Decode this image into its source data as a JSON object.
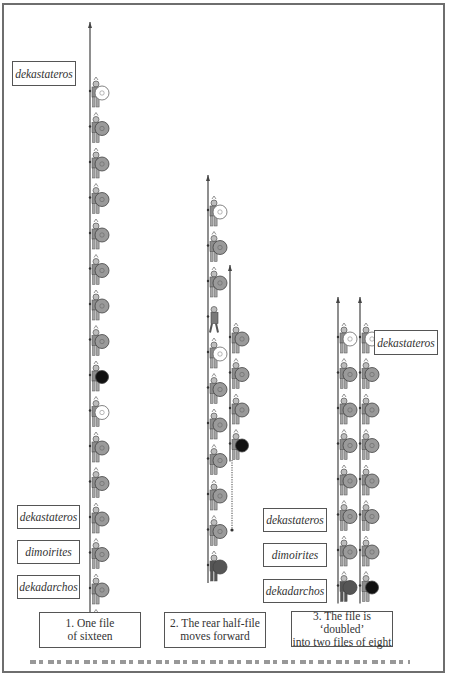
{
  "figure": {
    "colors": {
      "shield_grey": "#9a9a9a",
      "shield_white": "#ffffff",
      "shield_black": "#111111",
      "shield_dark": "#555555",
      "figure_grey": "#8c8c8c",
      "spear": "#444444",
      "box_border": "#555555"
    }
  },
  "labels": {
    "col1_top": "dekastateros",
    "col1_dekastateros": "dekastateros",
    "col1_dimoirites": "dimoirites",
    "col1_dekadarchos": "dekadarchos",
    "col3_top": "dekastateros",
    "col3_dekastateros": "dekastateros",
    "col3_dimoirites": "dimoirites",
    "col3_dekadarchos": "dekadarchos"
  },
  "captions": {
    "step1": {
      "line1": "1. One file",
      "line2": "of sixteen"
    },
    "step2": {
      "line1": "2. The rear half-file",
      "line2": "moves forward"
    },
    "step3": {
      "line1": "3. The file is ‘doubled’",
      "line2": "into two files of eight"
    }
  },
  "columns": [
    {
      "id": "step1-single-file",
      "x": 92,
      "spear_top": 22,
      "soldiers": [
        "white",
        "grey",
        "grey",
        "grey",
        "grey",
        "grey",
        "grey",
        "grey",
        "black",
        "white",
        "grey",
        "grey",
        "grey",
        "grey",
        "grey",
        "dark"
      ],
      "start_y": 97,
      "spacing": 35.5
    },
    {
      "id": "step2-front-half",
      "x": 210,
      "spear_top": 175,
      "soldiers": [
        "white",
        "grey",
        "grey",
        "walking",
        "white",
        "grey",
        "grey",
        "grey",
        "grey",
        "grey",
        "dark"
      ],
      "start_y": 216,
      "spacing": 35.5,
      "walking_index": 3
    },
    {
      "id": "step2-rear-half-moving",
      "x": 232,
      "spear_top": 265,
      "soldiers": [
        "grey",
        "grey",
        "grey",
        "black"
      ],
      "start_y": 343,
      "spacing": 35.5,
      "arrow": {
        "x": 232,
        "y1": 460,
        "y2": 530,
        "style": "dotted"
      }
    },
    {
      "id": "step3-file-a",
      "x": 340,
      "spear_top": 297,
      "soldiers": [
        "white",
        "grey",
        "grey",
        "grey",
        "grey",
        "grey",
        "grey",
        "dark"
      ],
      "start_y": 343,
      "spacing": 35.5
    },
    {
      "id": "step3-file-b",
      "x": 362,
      "spear_top": 297,
      "soldiers": [
        "white",
        "grey",
        "grey",
        "grey",
        "grey",
        "grey",
        "grey",
        "black"
      ],
      "start_y": 343,
      "spacing": 35.5
    }
  ]
}
